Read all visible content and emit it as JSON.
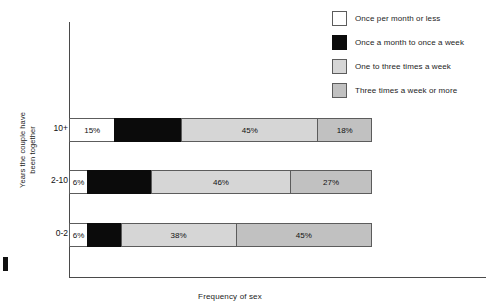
{
  "chart_data": {
    "type": "bar",
    "orientation": "horizontal",
    "stacked": true,
    "stacked_percent": true,
    "title": "",
    "xlabel": "Frequency of sex",
    "ylabel": "Years the couple have\nbeen together",
    "xlim": [
      0,
      100
    ],
    "grid": false,
    "legend_position": "top-right",
    "categories": [
      "10+",
      "2-10",
      "0-2"
    ],
    "series": [
      {
        "name": "Once per month or less",
        "color": "#ffffff",
        "values": [
          15,
          6,
          6
        ],
        "labels": [
          "15%",
          "6%",
          "6%"
        ]
      },
      {
        "name": "Once a month to once a week",
        "color": "#0b0b0b",
        "values": [
          22,
          21,
          11
        ],
        "labels": [
          "",
          "",
          ""
        ]
      },
      {
        "name": "One to three times a week",
        "color": "#d6d6d6",
        "values": [
          45,
          46,
          38
        ],
        "labels": [
          "45%",
          "46%",
          "38%"
        ]
      },
      {
        "name": "Three times a week or more",
        "color": "#c1c1c1",
        "values": [
          18,
          27,
          45
        ],
        "labels": [
          "18%",
          "27%",
          "45%"
        ]
      }
    ]
  },
  "axes": {
    "x_title": "Frequency of sex",
    "y_title": "Years the couple have\nbeen together",
    "y_ticks": [
      "10+",
      "2-10",
      "0-2"
    ]
  },
  "legend": {
    "items": [
      {
        "label": "Once per month or less",
        "swatch": "white"
      },
      {
        "label": "Once a month to once a week",
        "swatch": "black"
      },
      {
        "label": "One to three times a week",
        "swatch": "light"
      },
      {
        "label": "Three times a week or more",
        "swatch": "mid"
      }
    ]
  },
  "bars": [
    {
      "category": "10+",
      "segments": [
        {
          "label": "15%",
          "value": 15,
          "style": "white",
          "label_inside": true
        },
        {
          "label": "",
          "value": 22,
          "style": "black",
          "label_inside": true
        },
        {
          "label": "45%",
          "value": 45,
          "style": "light",
          "label_inside": true
        },
        {
          "label": "18%",
          "value": 18,
          "style": "mid",
          "label_inside": true
        }
      ]
    },
    {
      "category": "2-10",
      "segments": [
        {
          "label": "6%",
          "value": 6,
          "style": "white",
          "label_inside": true
        },
        {
          "label": "",
          "value": 21,
          "style": "black",
          "label_inside": true
        },
        {
          "label": "46%",
          "value": 46,
          "style": "light",
          "label_inside": true
        },
        {
          "label": "27%",
          "value": 27,
          "style": "mid",
          "label_inside": true
        }
      ]
    },
    {
      "category": "0-2",
      "segments": [
        {
          "label": "6%",
          "value": 6,
          "style": "white",
          "label_inside": true
        },
        {
          "label": "",
          "value": 11,
          "style": "black",
          "label_inside": true
        },
        {
          "label": "38%",
          "value": 38,
          "style": "light",
          "label_inside": true
        },
        {
          "label": "45%",
          "value": 45,
          "style": "mid",
          "label_inside": true
        }
      ]
    }
  ]
}
